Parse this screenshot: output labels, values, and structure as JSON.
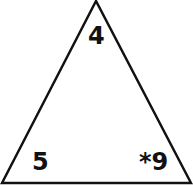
{
  "diagram": {
    "shape": "triangle",
    "stroke_color": "#111111",
    "background": "#ffffff",
    "labels": {
      "top": "4",
      "bottom_left": "5",
      "bottom_right": "*9"
    }
  }
}
